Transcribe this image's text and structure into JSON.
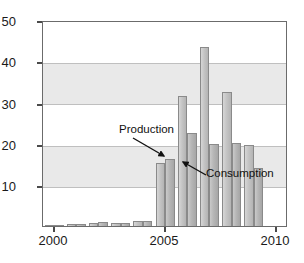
{
  "chart_data": {
    "type": "bar",
    "title": "",
    "subtitle": "",
    "xlabel": "",
    "ylabel": "",
    "xlim": [
      1999.5,
      2010.5
    ],
    "ylim": [
      0,
      50
    ],
    "grid": true,
    "legend_position": "inline-annotations",
    "categories": [
      2000,
      2001,
      2002,
      2003,
      2004,
      2005,
      2006,
      2007,
      2008,
      2009
    ],
    "series": [
      {
        "name": "Production",
        "values": [
          0.2,
          0.6,
          0.8,
          0.7,
          1.3,
          15.5,
          32.0,
          44.0,
          33.0,
          20.0
        ]
      },
      {
        "name": "Consumption",
        "values": [
          0.2,
          0.6,
          1.0,
          0.8,
          1.3,
          16.5,
          23.0,
          20.2,
          20.5,
          14.2
        ]
      }
    ],
    "yticks": [
      10,
      20,
      30,
      40,
      50
    ],
    "ytick_labels": [
      "10",
      "20",
      "30",
      "40",
      "50"
    ],
    "xticks": [
      2000,
      2005,
      2010
    ],
    "xtick_labels": [
      "2000",
      "2005",
      "2010"
    ],
    "annotations": [
      {
        "text": "Production",
        "points_to_series": "Production",
        "points_to_category": 2005
      },
      {
        "text": "Consumption",
        "points_to_series": "Consumption",
        "points_to_category": 2006
      }
    ],
    "colors": {
      "production_bar": "#c4c4c4",
      "consumption_bar": "#b6b6b6",
      "bar_outline": "#8a8a8a",
      "band": "#e9e9e9",
      "gridline": "#bfbfbf",
      "frame": "#6b6b6b",
      "text": "#1a1a1a",
      "background": "#ffffff"
    }
  }
}
